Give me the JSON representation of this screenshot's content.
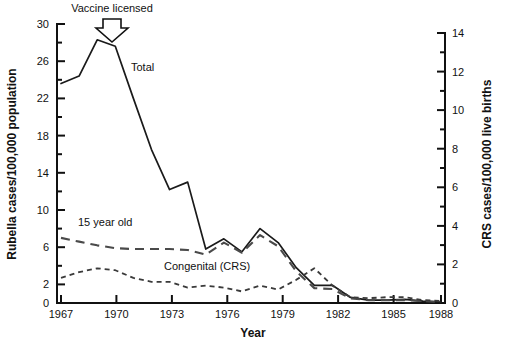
{
  "chart_data": {
    "type": "line",
    "title": "",
    "xlabel": "Year",
    "ylabel": "Rubella cases/100,000 population",
    "y2label": "CRS cases/100,000 live births",
    "xlim": [
      1967,
      1988
    ],
    "ylim": [
      0,
      30
    ],
    "y2lim": [
      0,
      14
    ],
    "grid": false,
    "legend_position": "inline-labels",
    "xticks": [
      "1967",
      "1970",
      "1973",
      "1976",
      "1979",
      "1982",
      "1985",
      "1988"
    ],
    "xtick_values": [
      1967,
      1970,
      1973,
      1976,
      1979,
      1982,
      1985,
      1988
    ],
    "yticks": [
      "0",
      "2",
      "6",
      "10",
      "14",
      "18",
      "22",
      "26",
      "30"
    ],
    "ytick_values": [
      0,
      2,
      6,
      10,
      14,
      18,
      22,
      26,
      30
    ],
    "yminor_values": [
      4,
      8,
      12,
      16,
      20,
      24,
      28
    ],
    "y2ticks": [
      "0",
      "2",
      "4",
      "6",
      "8",
      "10",
      "12",
      "14"
    ],
    "y2tick_values": [
      0,
      2,
      4,
      6,
      8,
      10,
      12,
      14
    ],
    "y2minor_values": [
      1,
      3,
      5,
      7,
      9,
      11,
      13
    ],
    "x": [
      1967,
      1968,
      1969,
      1970,
      1971,
      1972,
      1973,
      1974,
      1975,
      1976,
      1977,
      1978,
      1979,
      1980,
      1981,
      1982,
      1983,
      1984,
      1985,
      1986,
      1987,
      1988
    ],
    "series": [
      {
        "name": "Total",
        "axis": "left",
        "style": "solid",
        "label_text": "Total",
        "values": [
          23.6,
          24.4,
          28.3,
          27.6,
          22.0,
          16.5,
          12.2,
          13.0,
          5.8,
          6.9,
          5.5,
          8.0,
          6.5,
          3.8,
          1.9,
          1.9,
          0.6,
          0.3,
          0.3,
          0.4,
          0.2,
          0.1
        ]
      },
      {
        "name": "15 year old",
        "axis": "left",
        "style": "dashed",
        "label_text": "15 year old",
        "values": [
          7.0,
          6.6,
          6.2,
          5.9,
          5.8,
          5.8,
          5.8,
          5.7,
          5.2,
          6.5,
          5.4,
          7.3,
          6.1,
          3.4,
          1.6,
          1.5,
          0.5,
          0.3,
          0.3,
          0.3,
          0.2,
          0.1
        ]
      },
      {
        "name": "Congenital (CRS)",
        "axis": "right",
        "style": "dotted",
        "label_text": "Congenital (CRS)",
        "values": [
          1.3,
          1.6,
          1.8,
          1.7,
          1.3,
          1.1,
          1.1,
          0.8,
          0.9,
          0.8,
          0.6,
          0.9,
          0.7,
          1.2,
          1.8,
          0.9,
          0.3,
          0.25,
          0.3,
          0.3,
          0.15,
          0.1
        ]
      }
    ],
    "annotations": [
      {
        "name": "vaccine-licensed",
        "text": "Vaccine licensed",
        "x": 1969.4,
        "marker": "down-arrow-outline"
      }
    ]
  }
}
